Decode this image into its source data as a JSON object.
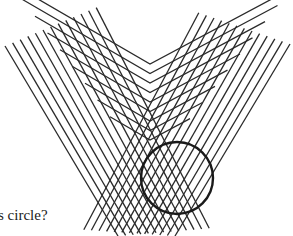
{
  "figure": {
    "line_color": "#2a2a2a",
    "circle_color": "#1a1a1a",
    "circle": {
      "cx": 177,
      "cy": 178,
      "r": 36,
      "stroke_width": 2.4
    },
    "chevrons": {
      "count": 9,
      "apex_x": 150,
      "apex_y_start": 140,
      "apex_step": -9.5,
      "half_width_start": 40,
      "half_width_step": 12.5,
      "slope": 0.58
    },
    "left_band": {
      "count": 13,
      "start": {
        "x": 5,
        "y": 46
      },
      "end": {
        "x": 118,
        "y": 236
      },
      "step_x": 7.6,
      "step_y": -3.2
    },
    "right_band": {
      "count": 13,
      "start": {
        "x": 290,
        "y": 44
      },
      "end": {
        "x": 175,
        "y": 236
      },
      "step_x": -7.6,
      "step_y": -2.6
    }
  },
  "caption": {
    "text": "s circle?"
  }
}
